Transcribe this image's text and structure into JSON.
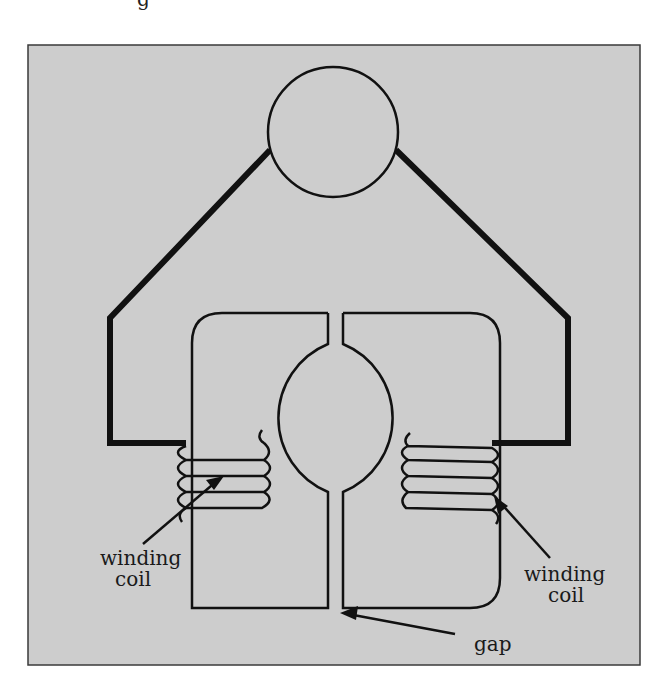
{
  "diagram": {
    "type": "electromagnetic-core-schematic",
    "colors": {
      "background": "#ffffff",
      "panel_fill": "#cdcdcd",
      "panel_border": "#3a3a3a",
      "stroke": "#111111"
    },
    "top_fragment": "g",
    "labels": {
      "left_coil_line1": "winding",
      "left_coil_line2": "coil",
      "right_coil_line1": "winding",
      "right_coil_line2": "coil",
      "gap": "gap"
    },
    "components": [
      {
        "id": "top-circle",
        "shape": "circle"
      },
      {
        "id": "yoke",
        "shape": "thick-polyline"
      },
      {
        "id": "left-core",
        "shape": "rounded-c-core"
      },
      {
        "id": "right-core",
        "shape": "rounded-c-core"
      },
      {
        "id": "rotor-bore",
        "shape": "circle"
      },
      {
        "id": "left-winding",
        "shape": "coil",
        "turns": 4
      },
      {
        "id": "right-winding",
        "shape": "coil",
        "turns": 4
      }
    ]
  }
}
